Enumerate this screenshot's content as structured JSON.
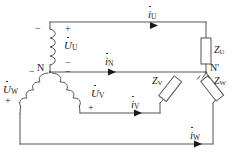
{
  "diagram": {
    "stroke_color": "#555555",
    "text_color": "#1a1a1a",
    "background": "#ffffff",
    "nodes": {
      "source_neutral": "N",
      "load_neutral": "N'"
    },
    "sources": [
      {
        "id": "u",
        "label": "U",
        "symbol": "U",
        "subscript": "U",
        "overdot": true
      },
      {
        "id": "v",
        "label": "V",
        "symbol": "U",
        "subscript": "V",
        "overdot": true
      },
      {
        "id": "w",
        "label": "W",
        "symbol": "U",
        "subscript": "W",
        "overdot": true
      }
    ],
    "currents": [
      {
        "id": "iu",
        "symbol": "i",
        "subscript": "U",
        "overdot": true
      },
      {
        "id": "in",
        "symbol": "i",
        "subscript": "N",
        "overdot": true
      },
      {
        "id": "iv",
        "symbol": "i",
        "subscript": "V",
        "overdot": true
      },
      {
        "id": "iw",
        "symbol": "i",
        "subscript": "W",
        "overdot": true
      }
    ],
    "impedances": [
      {
        "id": "zu",
        "symbol": "Z",
        "subscript": "U"
      },
      {
        "id": "zv",
        "symbol": "Z",
        "subscript": "V"
      },
      {
        "id": "zw",
        "symbol": "Z",
        "subscript": "W"
      }
    ],
    "polarity_marks": [
      {
        "id": "u-minus-left",
        "sign": "−"
      },
      {
        "id": "u-plus-right",
        "sign": "+"
      },
      {
        "id": "n-minus-upper",
        "sign": "−"
      },
      {
        "id": "n-minus-lower",
        "sign": "−"
      },
      {
        "id": "w-minus",
        "sign": "−"
      },
      {
        "id": "w-plus",
        "sign": "+"
      },
      {
        "id": "v-plus",
        "sign": "+"
      }
    ]
  }
}
